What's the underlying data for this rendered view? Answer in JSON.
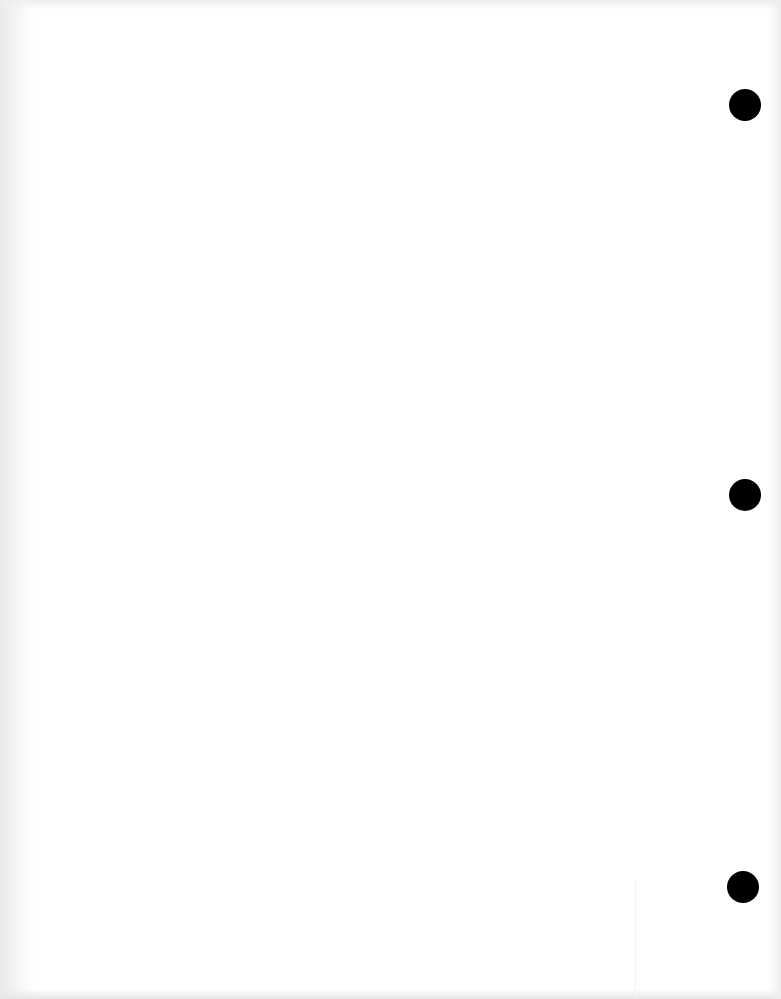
{
  "document": {
    "type": "blank-scanned-page",
    "background_color": "#ffffff",
    "text_content": "",
    "punch_holes": [
      {
        "position": "top",
        "center_x": 745,
        "center_y": 105,
        "diameter": 32,
        "color": "#000000"
      },
      {
        "position": "middle",
        "center_x": 745,
        "center_y": 495,
        "diameter": 32,
        "color": "#000000"
      },
      {
        "position": "bottom",
        "center_x": 743,
        "center_y": 887,
        "diameter": 32,
        "color": "#000000"
      }
    ],
    "edge_shadow_color": "#e9e9e9"
  }
}
